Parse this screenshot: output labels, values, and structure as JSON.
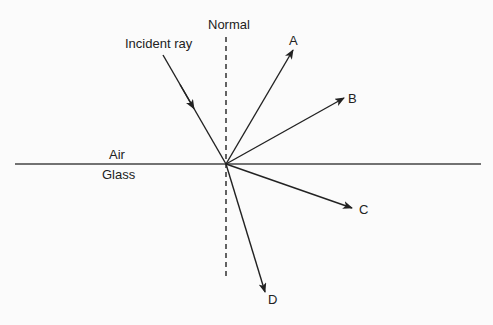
{
  "diagram": {
    "labels": {
      "normal": "Normal",
      "incident_ray": "Incident ray",
      "air": "Air",
      "glass": "Glass",
      "ray_a": "A",
      "ray_b": "B",
      "ray_c": "C",
      "ray_d": "D"
    },
    "point_of_incidence": [
      226,
      164
    ],
    "boundary": {
      "x1": 15,
      "x2": 481,
      "y": 164
    },
    "normal_line": {
      "x": 226,
      "y1": 37,
      "y2": 277,
      "style": "dashed"
    },
    "rays": [
      {
        "id": "incident",
        "from": [
          163,
          55
        ],
        "to": [
          226,
          164
        ],
        "arrow": "midpoint"
      },
      {
        "id": "A",
        "from": [
          226,
          164
        ],
        "to": [
          293,
          50
        ],
        "arrow": "end"
      },
      {
        "id": "B",
        "from": [
          226,
          164
        ],
        "to": [
          344,
          98
        ],
        "arrow": "end"
      },
      {
        "id": "C",
        "from": [
          226,
          164
        ],
        "to": [
          352,
          208
        ],
        "arrow": "end"
      },
      {
        "id": "D",
        "from": [
          226,
          164
        ],
        "to": [
          265,
          292
        ],
        "arrow": "end"
      }
    ],
    "colors": {
      "line": "#222222",
      "background": "#fbfbfb"
    }
  }
}
